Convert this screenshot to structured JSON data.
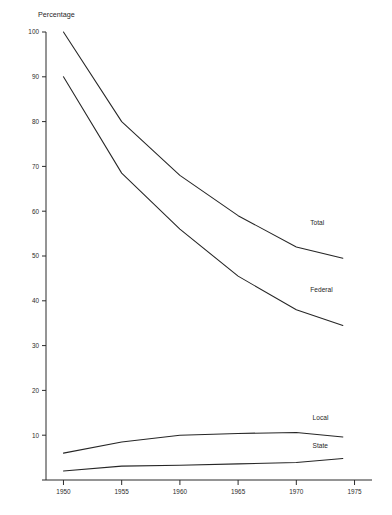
{
  "chart_data": {
    "type": "line",
    "title": "",
    "xlabel": "",
    "ylabel": "Percentage",
    "ylim": [
      0,
      100
    ],
    "xlim": [
      1948.5,
      1976.5
    ],
    "grid": false,
    "legend_position": "inline-right-of-line",
    "y_ticks": [
      0,
      10,
      20,
      30,
      40,
      50,
      60,
      70,
      80,
      90,
      100
    ],
    "y_tick_labels": [
      "0",
      "10",
      "20",
      "30",
      "40",
      "50",
      "60",
      "70",
      "80",
      "90",
      "100"
    ],
    "x_ticks": [
      1950,
      1955,
      1960,
      1965,
      1970,
      1975
    ],
    "x_tick_labels": [
      "1950",
      "1955",
      "1960",
      "1965",
      "1970",
      "1975"
    ],
    "x": [
      1950,
      1955,
      1960,
      1965,
      1970,
      1974
    ],
    "series": [
      {
        "name": "Total",
        "label": "Total",
        "color": "#262626",
        "values": [
          100,
          80,
          68,
          59,
          52,
          49.5
        ],
        "label_at": {
          "x": 1971.2,
          "y": 57
        }
      },
      {
        "name": "Federal",
        "label": "Federal",
        "color": "#262626",
        "values": [
          90,
          68.5,
          56,
          45.5,
          38,
          34.5
        ],
        "label_at": {
          "x": 1971.2,
          "y": 42
        }
      },
      {
        "name": "Local",
        "label": "Local",
        "color": "#262626",
        "values": [
          6,
          8.5,
          10,
          10.4,
          10.6,
          9.6
        ],
        "label_at": {
          "x": 1971.4,
          "y": 13.3
        }
      },
      {
        "name": "State",
        "label": "State",
        "color": "#262626",
        "values": [
          2,
          3.1,
          3.3,
          3.6,
          3.9,
          4.8
        ],
        "label_at": {
          "x": 1971.4,
          "y": 7.2
        }
      }
    ]
  }
}
